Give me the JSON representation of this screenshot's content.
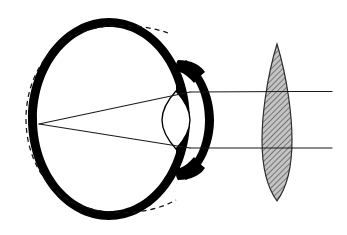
{
  "figure": {
    "title": "Myopic eye with corrective biconvex lens",
    "type": "anatomical-optical-diagram",
    "background_color": "#ffffff",
    "ink_color": "#000000",
    "canvas": {
      "width": 347,
      "height": 235
    }
  },
  "geometry": {
    "eyeball": {
      "label": "eyeball-sclera",
      "center_x": 109,
      "center_y": 119,
      "radius_x": 81,
      "radius_y": 101,
      "wall_thickness": 9,
      "fill": "#000000"
    },
    "normal_eye_reference": {
      "label": "dashed-normal-eye-outline",
      "center_x": 116,
      "center_y": 119,
      "radius_x": 78,
      "radius_y": 97,
      "stroke": "#111111",
      "stroke_width": 1.2,
      "dash_pattern": "5,4"
    },
    "cornea": {
      "label": "cornea-arc",
      "top_x": 189,
      "top_y": 62,
      "bottom_x": 189,
      "bottom_y": 178,
      "apex_x": 214,
      "apex_y": 120,
      "thickness": 9
    },
    "iris_top": {
      "label": "iris-upper-wedge",
      "tip_x": 180,
      "tip_y": 93
    },
    "iris_bottom": {
      "label": "iris-lower-wedge",
      "tip_x": 180,
      "tip_y": 147
    },
    "crystalline_lens": {
      "label": "crystalline-lens",
      "center_x": 176,
      "top_y": 91,
      "bottom_y": 149,
      "half_width": 14,
      "fill": "#ffffff",
      "stroke": "#000000",
      "stroke_width": 1.3
    },
    "corrective_lens": {
      "label": "external-biconvex-lens",
      "center_x": 277,
      "top_tip_y": 44,
      "bottom_tip_y": 201,
      "half_width": 15,
      "fill": "#b9b9b9",
      "stroke": "#3a3a3a",
      "stroke_width": 1.1,
      "hatch_angle_deg": 45,
      "hatch_spacing": 3
    },
    "focal_point": {
      "x": 39,
      "y": 124,
      "label": "retinal-focal-point"
    },
    "rays": [
      {
        "label": "upper-ray",
        "incoming_start_x": 332,
        "incoming_y": 92,
        "lens_exit_x": 277,
        "cornea_entry_x": 190,
        "focus_x": 39,
        "focus_y": 124
      },
      {
        "label": "lower-ray",
        "incoming_start_x": 332,
        "incoming_y": 148,
        "lens_exit_x": 277,
        "cornea_entry_x": 190,
        "focus_x": 39,
        "focus_y": 124
      }
    ],
    "ray_stroke": "#1a1a1a",
    "ray_stroke_width": 1.1
  }
}
